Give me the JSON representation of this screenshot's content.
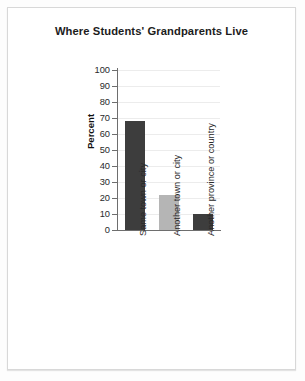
{
  "figure": {
    "title": "Where Students' Grandparents Live"
  },
  "chart_data": {
    "type": "bar",
    "title": "Where Students' Grandparents Live",
    "xlabel": "",
    "ylabel": "Percent",
    "categories": [
      "Same town or city",
      "Another town or city",
      "Another province or country"
    ],
    "values": [
      68,
      22,
      10
    ],
    "ylim": [
      0,
      100
    ],
    "yticks": [
      0,
      10,
      20,
      30,
      40,
      50,
      60,
      70,
      80,
      90,
      100
    ],
    "ytick_labels": [
      "0",
      "10",
      "20",
      "30",
      "40",
      "50",
      "60",
      "70",
      "80",
      "90",
      "100"
    ],
    "grid": true,
    "legend": "none",
    "bar_colors": [
      "#3d3d3d",
      "#b5b5b5",
      "#3d3d3d"
    ],
    "colors": {
      "gridline": "#ececec",
      "axis": "#6e6e6e",
      "text": "#2a2a2a",
      "title": "#1c1c1c",
      "background": "#ffffff",
      "frame_border": "#d8d8d8"
    }
  }
}
